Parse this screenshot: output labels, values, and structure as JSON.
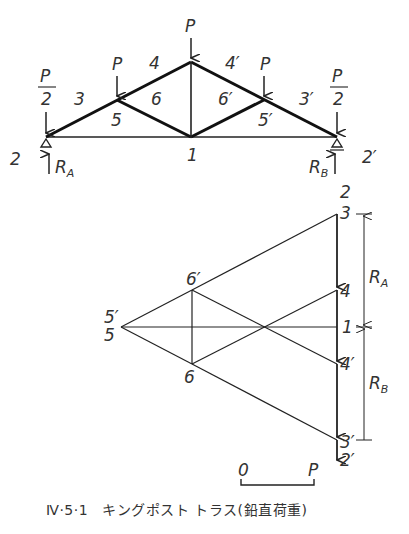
{
  "figure": {
    "number": "Ⅳ·5·1",
    "caption": "キングポスト トラス(鉛直荷重)"
  },
  "truss": {
    "loads": {
      "apex": "P",
      "left_mid": "P",
      "right_mid": "P",
      "left_end_num": "P",
      "left_end_den": "2",
      "right_end_num": "P",
      "right_end_den": "2"
    },
    "regions": {
      "r2": "2",
      "r3": "3",
      "r4": "4",
      "r4p": "4′",
      "r3p": "3′",
      "r2p": "2′",
      "r5": "5",
      "r6": "6",
      "r6p": "6′",
      "r5p": "5′",
      "r1": "1"
    },
    "reactions": {
      "left": "R",
      "left_sub": "A",
      "right": "R",
      "right_sub": "B"
    }
  },
  "force_diagram": {
    "points": {
      "p2": "2",
      "p3": "3",
      "p4": "4",
      "p1": "1",
      "p4p": "4′",
      "p3p": "3′",
      "p2p": "2′",
      "p5p": "5′",
      "p5": "5",
      "p6p": "6′",
      "p6": "6"
    },
    "dimensions": {
      "ra": "R",
      "ra_sub": "A",
      "rb": "R",
      "rb_sub": "B"
    }
  },
  "scale": {
    "zero": "0",
    "unit": "P"
  }
}
